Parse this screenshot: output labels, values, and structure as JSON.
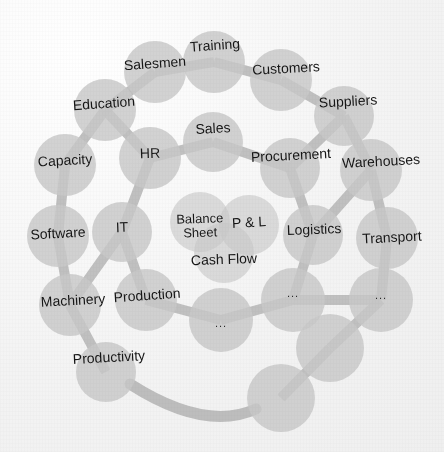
{
  "figure": {
    "colors": {
      "background": "#f2f2f2",
      "node_fill": "#c8c8c8",
      "link_fill": "#bdbdbd",
      "label_text": "#151515"
    }
  },
  "center_cluster": {
    "nodes": [
      {
        "id": "balance-sheet",
        "label": "Balance Sheet",
        "cx": 200,
        "cy": 222,
        "r": 30,
        "lx": 200,
        "ly": 221,
        "fs": 13,
        "rot": -2,
        "two_line": true,
        "lw": 64
      },
      {
        "id": "p-and-l",
        "label": "P & L",
        "cx": 249,
        "cy": 225,
        "r": 30,
        "lx": 249,
        "ly": 225,
        "fs": 14,
        "rot": -3,
        "two_line": false,
        "lw": 60
      },
      {
        "id": "cash-flow",
        "label": "Cash Flow",
        "cx": 224,
        "cy": 253,
        "r": 30,
        "lx": 224,
        "ly": 262,
        "fs": 14,
        "rot": -2,
        "two_line": false,
        "lw": 80
      }
    ]
  },
  "middle_ring": {
    "nodes": [
      {
        "id": "sales",
        "label": "Sales",
        "cx": 213,
        "cy": 142,
        "r": 30,
        "lx": 213,
        "ly": 131,
        "fs": 14,
        "rot": -3,
        "two_line": false,
        "lw": 60
      },
      {
        "id": "procurement",
        "label": "Procurement",
        "cx": 290,
        "cy": 168,
        "r": 30,
        "lx": 291,
        "ly": 158,
        "fs": 14,
        "rot": -3,
        "two_line": false,
        "lw": 96
      },
      {
        "id": "logistics",
        "label": "Logistics",
        "cx": 313,
        "cy": 235,
        "r": 30,
        "lx": 314,
        "ly": 232,
        "fs": 14,
        "rot": -2,
        "two_line": false,
        "lw": 74
      },
      {
        "id": "dots-mid-1",
        "label": "...",
        "cx": 293,
        "cy": 300,
        "r": 32,
        "lx": 293,
        "ly": 296,
        "fs": 11,
        "rot": 0,
        "two_line": false,
        "lw": 30
      },
      {
        "id": "dots-mid-2",
        "label": "...",
        "cx": 221,
        "cy": 320,
        "r": 32,
        "lx": 221,
        "ly": 326,
        "fs": 11,
        "rot": 0,
        "two_line": false,
        "lw": 30
      },
      {
        "id": "production",
        "label": "Production",
        "cx": 146,
        "cy": 300,
        "r": 31,
        "lx": 147,
        "ly": 298,
        "fs": 14,
        "rot": -4,
        "two_line": false,
        "lw": 86
      },
      {
        "id": "it",
        "label": "IT",
        "cx": 122,
        "cy": 232,
        "r": 30,
        "lx": 122,
        "ly": 230,
        "fs": 14,
        "rot": -2,
        "two_line": false,
        "lw": 30
      },
      {
        "id": "hr",
        "label": "HR",
        "cx": 150,
        "cy": 158,
        "r": 31,
        "lx": 150,
        "ly": 156,
        "fs": 14,
        "rot": -2,
        "two_line": false,
        "lw": 34
      }
    ]
  },
  "outer_ring": {
    "nodes": [
      {
        "id": "training",
        "label": "Training",
        "cx": 214,
        "cy": 62,
        "r": 31,
        "lx": 215,
        "ly": 48,
        "fs": 14,
        "rot": -4,
        "two_line": false,
        "lw": 70
      },
      {
        "id": "customers",
        "label": "Customers",
        "cx": 281,
        "cy": 80,
        "r": 31,
        "lx": 286,
        "ly": 71,
        "fs": 14,
        "rot": -3,
        "two_line": false,
        "lw": 84
      },
      {
        "id": "suppliers",
        "label": "Suppliers",
        "cx": 344,
        "cy": 116,
        "r": 30,
        "lx": 348,
        "ly": 104,
        "fs": 14,
        "rot": -3,
        "two_line": false,
        "lw": 74
      },
      {
        "id": "warehouses",
        "label": "Warehouses",
        "cx": 371,
        "cy": 170,
        "r": 31,
        "lx": 381,
        "ly": 164,
        "fs": 14,
        "rot": -3,
        "two_line": false,
        "lw": 94
      },
      {
        "id": "transport",
        "label": "Transport",
        "cx": 387,
        "cy": 238,
        "r": 31,
        "lx": 392,
        "ly": 240,
        "fs": 14,
        "rot": -3,
        "two_line": false,
        "lw": 78
      },
      {
        "id": "dots-out-1",
        "label": "...",
        "cx": 381,
        "cy": 300,
        "r": 32,
        "lx": 381,
        "ly": 298,
        "fs": 11,
        "rot": 0,
        "two_line": false,
        "lw": 30
      },
      {
        "id": "blank-out-1",
        "label": "",
        "cx": 330,
        "cy": 348,
        "r": 34,
        "lx": 330,
        "ly": 348,
        "fs": 14,
        "rot": 0,
        "two_line": false,
        "lw": 30
      },
      {
        "id": "blank-out-2",
        "label": "",
        "cx": 281,
        "cy": 398,
        "r": 34,
        "lx": 281,
        "ly": 398,
        "fs": 14,
        "rot": 0,
        "two_line": false,
        "lw": 30
      },
      {
        "id": "productivity",
        "label": "Productivity",
        "cx": 106,
        "cy": 372,
        "r": 30,
        "lx": 109,
        "ly": 360,
        "fs": 14,
        "rot": -3,
        "two_line": false,
        "lw": 94
      },
      {
        "id": "machinery",
        "label": "Machinery",
        "cx": 70,
        "cy": 305,
        "r": 31,
        "lx": 73,
        "ly": 303,
        "fs": 14,
        "rot": -3,
        "two_line": false,
        "lw": 84
      },
      {
        "id": "software",
        "label": "Software",
        "cx": 58,
        "cy": 236,
        "r": 31,
        "lx": 58,
        "ly": 236,
        "fs": 14,
        "rot": -3,
        "two_line": false,
        "lw": 74
      },
      {
        "id": "capacity",
        "label": "Capacity",
        "cx": 65,
        "cy": 165,
        "r": 31,
        "lx": 65,
        "ly": 163,
        "fs": 14,
        "rot": -3,
        "two_line": false,
        "lw": 72
      },
      {
        "id": "education",
        "label": "Education",
        "cx": 105,
        "cy": 110,
        "r": 31,
        "lx": 104,
        "ly": 106,
        "fs": 14,
        "rot": -4,
        "two_line": false,
        "lw": 80
      },
      {
        "id": "salesmen",
        "label": "Salesmen",
        "cx": 155,
        "cy": 72,
        "r": 31,
        "lx": 155,
        "ly": 66,
        "fs": 14,
        "rot": -4,
        "two_line": false,
        "lw": 80
      }
    ]
  },
  "links": {
    "straight": [
      {
        "id": "link-hr-sales",
        "from": "hr",
        "to": "sales"
      },
      {
        "id": "link-sales-procurement",
        "from": "sales",
        "to": "procurement"
      },
      {
        "id": "link-procurement-logistics",
        "from": "procurement",
        "to": "logistics"
      },
      {
        "id": "link-logistics-dots1",
        "from": "logistics",
        "to": "dots-mid-1"
      },
      {
        "id": "link-dots1-dots2",
        "from": "dots-mid-1",
        "to": "dots-mid-2"
      },
      {
        "id": "link-dots2-production",
        "from": "dots-mid-2",
        "to": "production"
      },
      {
        "id": "link-production-it",
        "from": "production",
        "to": "it"
      },
      {
        "id": "link-it-hr",
        "from": "it",
        "to": "hr"
      },
      {
        "id": "link-salesmen-training",
        "from": "salesmen",
        "to": "training"
      },
      {
        "id": "link-training-customers",
        "from": "training",
        "to": "customers"
      },
      {
        "id": "link-customers-suppliers",
        "from": "customers",
        "to": "suppliers"
      },
      {
        "id": "link-suppliers-warehouses",
        "from": "suppliers",
        "to": "warehouses"
      },
      {
        "id": "link-warehouses-transport",
        "from": "warehouses",
        "to": "transport"
      },
      {
        "id": "link-transport-dotsout1",
        "from": "transport",
        "to": "dots-out-1"
      },
      {
        "id": "link-dotsout1-blank1",
        "from": "dots-out-1",
        "to": "blank-out-1"
      },
      {
        "id": "link-blank1-blank2",
        "from": "blank-out-1",
        "to": "blank-out-2"
      },
      {
        "id": "link-machinery-productivity",
        "from": "machinery",
        "to": "productivity"
      },
      {
        "id": "link-software-machinery",
        "from": "software",
        "to": "machinery"
      },
      {
        "id": "link-capacity-software",
        "from": "capacity",
        "to": "software"
      },
      {
        "id": "link-education-capacity",
        "from": "education",
        "to": "capacity"
      },
      {
        "id": "link-salesmen-education",
        "from": "salesmen",
        "to": "education"
      },
      {
        "id": "link-education-hr",
        "from": "education",
        "to": "hr"
      },
      {
        "id": "link-suppliers-procurement",
        "from": "suppliers",
        "to": "procurement"
      },
      {
        "id": "link-warehouses-logistics",
        "from": "warehouses",
        "to": "logistics"
      },
      {
        "id": "link-dotsout1-dotsmid1",
        "from": "dots-out-1",
        "to": "dots-mid-1"
      },
      {
        "id": "link-machinery-it",
        "from": "machinery",
        "to": "it"
      }
    ],
    "curved": [
      {
        "id": "link-productivity-blank2",
        "from": "productivity",
        "to": "blank-out-2",
        "path": "M 130 384 Q 205 432 256 409",
        "width": 11
      }
    ]
  }
}
